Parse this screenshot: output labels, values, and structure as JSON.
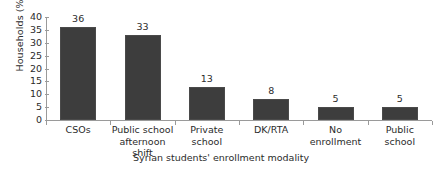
{
  "chart_data": {
    "type": "bar",
    "title": "",
    "subtitle": "",
    "xlabel": "Syrian students' enrollment modality",
    "ylabel": "Households (%)",
    "categories": [
      "CSOs",
      "Public school afternoon shift",
      "Private school",
      "DK/RTA",
      "No enrollment",
      "Public school"
    ],
    "category_lines": [
      [
        "CSOs"
      ],
      [
        "Public school",
        "afternoon shift"
      ],
      [
        "Private",
        "school"
      ],
      [
        "DK/RTA"
      ],
      [
        "No",
        "enrollment"
      ],
      [
        "Public",
        "school"
      ]
    ],
    "values": [
      36,
      33,
      13,
      8,
      5,
      5
    ],
    "data_labels": [
      "36",
      "33",
      "13",
      "8",
      "5",
      "5"
    ],
    "ylim": [
      0,
      40
    ],
    "yticks": [
      0,
      5,
      10,
      15,
      20,
      25,
      30,
      35,
      40
    ],
    "ytick_labels": [
      "0",
      "5",
      "10",
      "15",
      "20",
      "25",
      "30",
      "35",
      "40"
    ],
    "grid": false,
    "legend": false,
    "legend_position": "none",
    "bar_color": "#3d3d3d",
    "axis_color": "#9a9a9a",
    "text_color": "#2b2b2b",
    "background_color": "#ffffff"
  }
}
